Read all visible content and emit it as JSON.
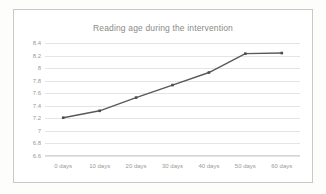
{
  "chart_data": {
    "type": "line",
    "title": "Reading age during the intervention",
    "xlabel": "",
    "ylabel": "",
    "categories": [
      "0 days",
      "10 days",
      "20 days",
      "30 days",
      "40 days",
      "50 days",
      "60 days"
    ],
    "values": [
      7.21,
      7.32,
      7.53,
      7.73,
      7.93,
      8.23,
      8.24
    ],
    "series": [
      {
        "name": "Reading age",
        "values": [
          7.21,
          7.32,
          7.53,
          7.73,
          7.93,
          8.23,
          8.24
        ]
      }
    ],
    "yticks": [
      "6.6",
      "6.8",
      "7",
      "7.2",
      "7.4",
      "7.6",
      "7.8",
      "8",
      "8.2",
      "8.4"
    ],
    "ytick_values": [
      6.6,
      6.8,
      7.0,
      7.2,
      7.4,
      7.6,
      7.8,
      8.0,
      8.2,
      8.4
    ],
    "ylim": [
      6.6,
      8.4
    ],
    "grid": true,
    "legend": false,
    "legend_position": "none",
    "marker": "square",
    "colors": {
      "line": "#595959",
      "marker": "#4d4d4d",
      "grid": "#e4e4e2",
      "tick_label": "#9a9a96",
      "title": "#8a8a86",
      "frame_border": "#c9c9c7",
      "plot_background": "#ffffff",
      "page_background": "#fdfdfc"
    }
  }
}
